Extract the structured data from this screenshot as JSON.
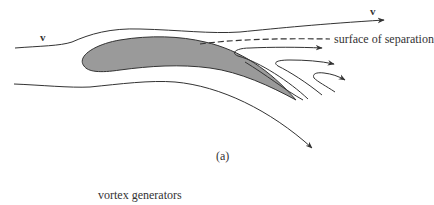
{
  "figure": {
    "panel_label": "(a)",
    "velocity_label_upstream": "v",
    "velocity_label_downstream": "v",
    "annotation_separation": "surface of separation",
    "caption_below": "vortex generators",
    "colors": {
      "airfoil_fill": "#9a9a9a",
      "stroke": "#333333",
      "background": "#ffffff"
    },
    "elements": [
      {
        "name": "airfoil",
        "type": "shaded-wing-section"
      },
      {
        "name": "upper-streamline",
        "type": "streamline-with-arrow"
      },
      {
        "name": "lower-streamline",
        "type": "streamline-with-arrow"
      },
      {
        "name": "separation-surface",
        "type": "dashed-line"
      },
      {
        "name": "vortex-streamlines",
        "type": "curled-streamlines",
        "count": 3
      }
    ]
  }
}
